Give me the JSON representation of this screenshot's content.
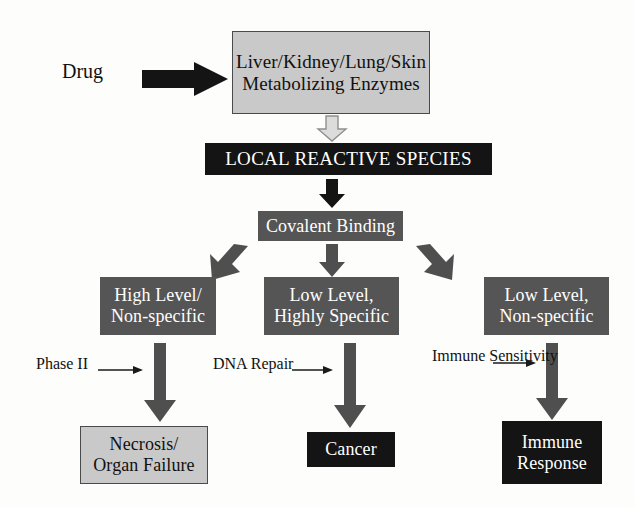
{
  "diagram": {
    "colors": {
      "light_box_fill": "#c9c9c9",
      "light_box_border": "#4a4a4a",
      "dark_box_fill": "#555555",
      "black_box_fill": "#141414",
      "black_arrow": "#1a1a1a",
      "gray_arrow": "#5a5a5a",
      "outline_arrow_fill": "#d8d8d8",
      "outline_arrow_stroke": "#8a8a8a",
      "text_on_dark": "#ffffff",
      "text_on_light": "#111111",
      "background": "#fdfdfc"
    },
    "input": {
      "label": "Drug"
    },
    "nodes": {
      "metabolizing": {
        "line1": "Liver/Kidney/Lung/Skin",
        "line2": "Metabolizing Enzymes",
        "style": "light"
      },
      "local_species": {
        "line1": "LOCAL REACTIVE SPECIES",
        "style": "black"
      },
      "covalent": {
        "line1": "Covalent Binding",
        "style": "dark"
      },
      "high_level": {
        "line1": "High Level/",
        "line2": "Non-specific",
        "style": "dark"
      },
      "low_highly_specific": {
        "line1": "Low Level,",
        "line2": "Highly Specific",
        "style": "dark"
      },
      "low_nonspecific": {
        "line1": "Low Level,",
        "line2": "Non-specific",
        "style": "dark"
      },
      "necrosis": {
        "line1": "Necrosis/",
        "line2": "Organ Failure",
        "style": "light"
      },
      "cancer": {
        "line1": "Cancer",
        "style": "black"
      },
      "immune_response": {
        "line1": "Immune",
        "line2": "Response",
        "style": "black"
      }
    },
    "annotations": {
      "phase2": {
        "line1": "Phase II",
        "line2": ""
      },
      "dna_repair": {
        "line1": "DNA Repair",
        "line2": ""
      },
      "immune_sensitivity": {
        "line1": "Immune",
        "line2": "Sensitivity"
      }
    },
    "edges": [
      {
        "from": "Drug",
        "to": "Liver/Kidney/Lung/Skin Metabolizing Enzymes",
        "style": "solid-black-block-arrow",
        "direction": "right"
      },
      {
        "from": "Liver/Kidney/Lung/Skin Metabolizing Enzymes",
        "to": "LOCAL REACTIVE SPECIES",
        "style": "outlined-gray-block-arrow",
        "direction": "down"
      },
      {
        "from": "LOCAL REACTIVE SPECIES",
        "to": "Covalent Binding",
        "style": "solid-black-block-arrow",
        "direction": "down"
      },
      {
        "from": "Covalent Binding",
        "to": "High Level/Non-specific",
        "style": "solid-gray-block-arrow",
        "direction": "down-left"
      },
      {
        "from": "Covalent Binding",
        "to": "Low Level, Highly Specific",
        "style": "solid-gray-block-arrow",
        "direction": "down"
      },
      {
        "from": "Covalent Binding",
        "to": "Low Level, Non-specific",
        "style": "solid-gray-block-arrow",
        "direction": "down-right"
      },
      {
        "from": "High Level/Non-specific",
        "to": "Necrosis/Organ Failure",
        "style": "solid-gray-block-arrow",
        "direction": "down",
        "modifier": "Phase II"
      },
      {
        "from": "Low Level, Highly Specific",
        "to": "Cancer",
        "style": "solid-gray-block-arrow",
        "direction": "down",
        "modifier": "DNA Repair"
      },
      {
        "from": "Low Level, Non-specific",
        "to": "Immune Response",
        "style": "solid-gray-block-arrow",
        "direction": "down",
        "modifier": "Immune Sensitivity"
      }
    ]
  }
}
